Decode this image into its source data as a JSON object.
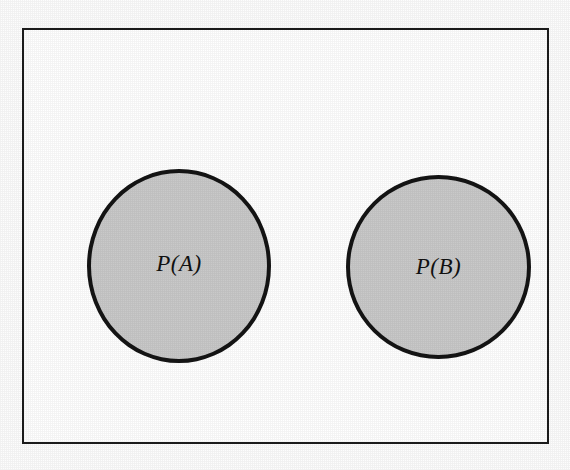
{
  "figure": {
    "kind": "venn-diagram",
    "background_color": "#fdfdfd"
  },
  "sample_space": {
    "name": "sample-space-rectangle",
    "border_color": "#1d1d1d",
    "fill_color": "#ffffff"
  },
  "events": [
    {
      "id": "a",
      "label": "P(A)",
      "fill_color": "#c9c9c9",
      "stroke_color": "#141414"
    },
    {
      "id": "b",
      "label": "P(B)",
      "fill_color": "#c9c9c9",
      "stroke_color": "#141414"
    }
  ]
}
